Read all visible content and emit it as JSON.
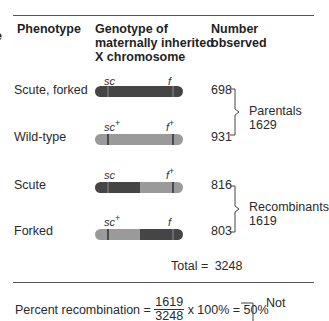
{
  "left_fragment": "e",
  "headers": {
    "phenotype": "Phenotype",
    "genotype_line1": "Genotype of",
    "genotype_line2": "maternally inherited",
    "genotype_line3": "X chromosome",
    "number_line1": "Number",
    "number_line2": "observed"
  },
  "rows": [
    {
      "phenotype": "Scute, forked",
      "left_allele": "sc",
      "left_sup": "",
      "right_allele": "f",
      "right_sup": "",
      "count": "698",
      "left_segment": "mutant",
      "right_segment": "mutant"
    },
    {
      "phenotype": "Wild-type",
      "left_allele": "sc",
      "left_sup": "+",
      "right_allele": "f",
      "right_sup": "+",
      "count": "931",
      "left_segment": "wild",
      "right_segment": "wild"
    },
    {
      "phenotype": "Scute",
      "left_allele": "sc",
      "left_sup": "",
      "right_allele": "f",
      "right_sup": "+",
      "count": "816",
      "left_segment": "mutant",
      "right_segment": "wild"
    },
    {
      "phenotype": "Forked",
      "left_allele": "sc",
      "left_sup": "+",
      "right_allele": "f",
      "right_sup": "",
      "count": "803",
      "left_segment": "wild",
      "right_segment": "mutant"
    }
  ],
  "groups": [
    {
      "label": "Parentals",
      "total": "1629"
    },
    {
      "label": "Recombinants",
      "total": "1619"
    }
  ],
  "total": {
    "label": "Total =",
    "value": "3248"
  },
  "formula": {
    "label": "Percent recombination =",
    "numerator": "1619",
    "denominator": "3248",
    "rest": "x 100% = 50%",
    "note": "Not"
  },
  "colors": {
    "mutant": "#454545",
    "wild": "#9a9a9a",
    "band_on_mutant": "#6a6a6a",
    "band_on_wild": "#4a4a4a",
    "rule": "#555555"
  }
}
